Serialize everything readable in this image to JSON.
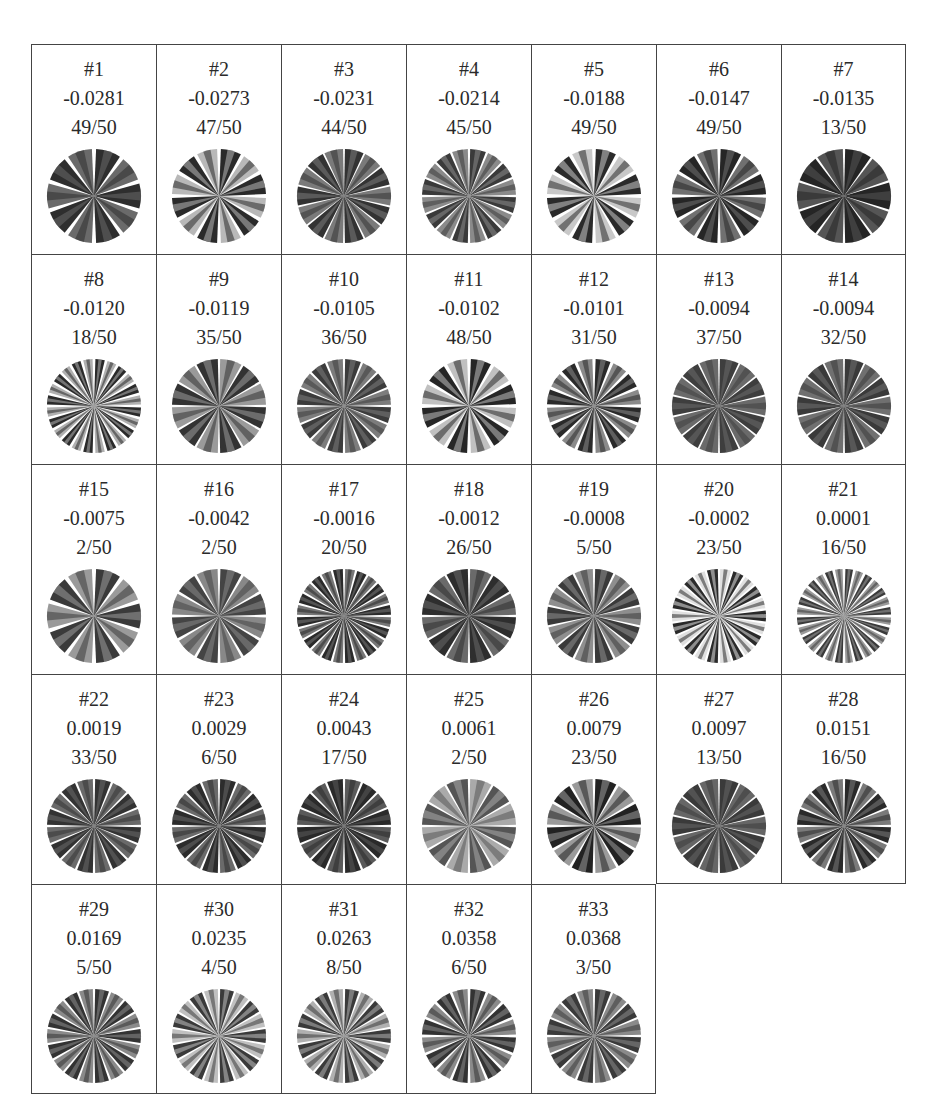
{
  "table": {
    "columns": 7,
    "cells": [
      {
        "id": "#1",
        "score": "-0.0281",
        "count": "49/50",
        "shade": "#2e2e2e",
        "alt": "#6a6a6a",
        "spokes": 10,
        "gap": 0.09
      },
      {
        "id": "#2",
        "score": "-0.0273",
        "count": "47/50",
        "shade": "#2a2a2a",
        "alt": "#b8b8b8",
        "spokes": 12,
        "gap": 0.08
      },
      {
        "id": "#3",
        "score": "-0.0231",
        "count": "44/50",
        "shade": "#333333",
        "alt": "#7a7a7a",
        "spokes": 14,
        "gap": 0.04
      },
      {
        "id": "#4",
        "score": "-0.0214",
        "count": "45/50",
        "shade": "#3a3a3a",
        "alt": "#8a8a8a",
        "spokes": 16,
        "gap": 0.05
      },
      {
        "id": "#5",
        "score": "-0.0188",
        "count": "49/50",
        "shade": "#2a2a2a",
        "alt": "#c8c8c8",
        "spokes": 12,
        "gap": 0.08
      },
      {
        "id": "#6",
        "score": "-0.0147",
        "count": "49/50",
        "shade": "#262626",
        "alt": "#707070",
        "spokes": 12,
        "gap": 0.07
      },
      {
        "id": "#7",
        "score": "-0.0135",
        "count": "13/50",
        "shade": "#252525",
        "alt": "#555555",
        "spokes": 10,
        "gap": 0.05
      },
      {
        "id": "#8",
        "score": "-0.0120",
        "count": "18/50",
        "shade": "#2a2a2a",
        "alt": "#b0b0b0",
        "spokes": 24,
        "gap": 0.06
      },
      {
        "id": "#9",
        "score": "-0.0119",
        "count": "35/50",
        "shade": "#9a9a9a",
        "alt": "#333333",
        "spokes": 12,
        "gap": 0.05
      },
      {
        "id": "#10",
        "score": "-0.0105",
        "count": "36/50",
        "shade": "#3c3c3c",
        "alt": "#7c7c7c",
        "spokes": 16,
        "gap": 0.05
      },
      {
        "id": "#11",
        "score": "-0.0102",
        "count": "48/50",
        "shade": "#262626",
        "alt": "#c0c0c0",
        "spokes": 12,
        "gap": 0.08
      },
      {
        "id": "#12",
        "score": "-0.0101",
        "count": "31/50",
        "shade": "#2a2a2a",
        "alt": "#8a8a8a",
        "spokes": 16,
        "gap": 0.07
      },
      {
        "id": "#13",
        "score": "-0.0094",
        "count": "37/50",
        "shade": "#3e3e3e",
        "alt": "#6a6a6a",
        "spokes": 14,
        "gap": 0.04
      },
      {
        "id": "#14",
        "score": "-0.0094",
        "count": "32/50",
        "shade": "#3a3a3a",
        "alt": "#707070",
        "spokes": 14,
        "gap": 0.04
      },
      {
        "id": "#15",
        "score": "-0.0075",
        "count": "2/50",
        "shade": "#3a3a3a",
        "alt": "#9a9a9a",
        "spokes": 10,
        "gap": 0.09
      },
      {
        "id": "#16",
        "score": "-0.0042",
        "count": "2/50",
        "shade": "#444444",
        "alt": "#888888",
        "spokes": 12,
        "gap": 0.06
      },
      {
        "id": "#17",
        "score": "-0.0016",
        "count": "20/50",
        "shade": "#777777",
        "alt": "#2a2a2a",
        "spokes": 24,
        "gap": 0.05
      },
      {
        "id": "#18",
        "score": "-0.0012",
        "count": "26/50",
        "shade": "#6a6a6a",
        "alt": "#2e2e2e",
        "spokes": 12,
        "gap": 0.05
      },
      {
        "id": "#19",
        "score": "-0.0008",
        "count": "5/50",
        "shade": "#3a3a3a",
        "alt": "#8e8e8e",
        "spokes": 14,
        "gap": 0.05
      },
      {
        "id": "#20",
        "score": "-0.0002",
        "count": "23/50",
        "shade": "#e0e0e0",
        "alt": "#2a2a2a",
        "spokes": 22,
        "gap": 0.05
      },
      {
        "id": "#21",
        "score": "0.0001",
        "count": "16/50",
        "shade": "#3a3a3a",
        "alt": "#9a9a9a",
        "spokes": 28,
        "gap": 0.06
      },
      {
        "id": "#22",
        "score": "0.0019",
        "count": "33/50",
        "shade": "#333333",
        "alt": "#6a6a6a",
        "spokes": 16,
        "gap": 0.05
      },
      {
        "id": "#23",
        "score": "0.0029",
        "count": "6/50",
        "shade": "#2c2c2c",
        "alt": "#6a6a6a",
        "spokes": 16,
        "gap": 0.05
      },
      {
        "id": "#24",
        "score": "0.0043",
        "count": "17/50",
        "shade": "#5a5a5a",
        "alt": "#2a2a2a",
        "spokes": 16,
        "gap": 0.05
      },
      {
        "id": "#25",
        "score": "0.0061",
        "count": "2/50",
        "shade": "#aaaaaa",
        "alt": "#555555",
        "spokes": 12,
        "gap": 0.05
      },
      {
        "id": "#26",
        "score": "0.0079",
        "count": "23/50",
        "shade": "#222222",
        "alt": "#9a9a9a",
        "spokes": 12,
        "gap": 0.06
      },
      {
        "id": "#27",
        "score": "0.0097",
        "count": "13/50",
        "shade": "#3a3a3a",
        "alt": "#666666",
        "spokes": 14,
        "gap": 0.04
      },
      {
        "id": "#28",
        "score": "0.0151",
        "count": "16/50",
        "shade": "#2a2a2a",
        "alt": "#7a7a7a",
        "spokes": 16,
        "gap": 0.05
      },
      {
        "id": "#29",
        "score": "0.0169",
        "count": "5/50",
        "shade": "#333333",
        "alt": "#8a8a8a",
        "spokes": 18,
        "gap": 0.05
      },
      {
        "id": "#30",
        "score": "0.0235",
        "count": "4/50",
        "shade": "#3a3a3a",
        "alt": "#c0c0c0",
        "spokes": 18,
        "gap": 0.05
      },
      {
        "id": "#31",
        "score": "0.0263",
        "count": "8/50",
        "shade": "#3a3a3a",
        "alt": "#b0b0b0",
        "spokes": 18,
        "gap": 0.05
      },
      {
        "id": "#32",
        "score": "0.0358",
        "count": "6/50",
        "shade": "#333333",
        "alt": "#8a8a8a",
        "spokes": 16,
        "gap": 0.06
      },
      {
        "id": "#33",
        "score": "0.0368",
        "count": "3/50",
        "shade": "#3a3a3a",
        "alt": "#8a8a8a",
        "spokes": 16,
        "gap": 0.05
      }
    ]
  }
}
